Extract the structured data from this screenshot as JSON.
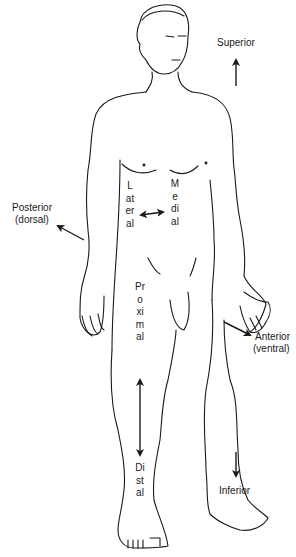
{
  "diagram": {
    "type": "anatomical-directional-terms",
    "labels": {
      "superior": "Superior",
      "inferior": "Inferior",
      "posterior": "Posterior",
      "posterior_alt": "(dorsal)",
      "anterior": "Anterior",
      "anterior_alt": "(ventral)",
      "lateral": "Lateral",
      "medial": "Medial",
      "proximal": "Proximal",
      "distal": "Distal"
    },
    "colors": {
      "line": "#1a1a1a",
      "background": "#ffffff"
    }
  }
}
